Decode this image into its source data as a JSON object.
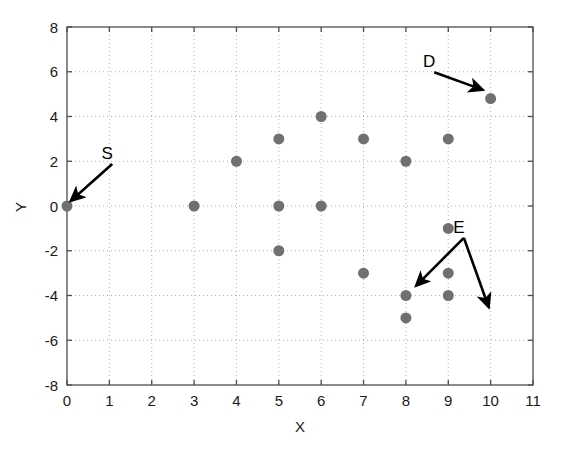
{
  "chart_data": {
    "type": "scatter",
    "title": "",
    "xlabel": "X",
    "ylabel": "Y",
    "xlim": [
      0,
      11
    ],
    "ylim": [
      -8,
      8
    ],
    "xticks": [
      0,
      1,
      2,
      3,
      4,
      5,
      6,
      7,
      8,
      9,
      10,
      11
    ],
    "xtick_labels": [
      "0",
      "1",
      "2",
      "3",
      "4",
      "5",
      "6",
      "7",
      "8",
      "9",
      "10",
      "11"
    ],
    "yticks": [
      -8,
      -6,
      -4,
      -2,
      0,
      2,
      4,
      6,
      8
    ],
    "ytick_labels": [
      "-8",
      "-6",
      "-4",
      "-2",
      "0",
      "2",
      "4",
      "6",
      "8"
    ],
    "grid": true,
    "grid_style": "dotted",
    "legend": null,
    "marker": {
      "shape": "circle",
      "color": "#707070",
      "size": 11
    },
    "points": [
      {
        "x": 0,
        "y": 0
      },
      {
        "x": 3,
        "y": 0
      },
      {
        "x": 4,
        "y": 2
      },
      {
        "x": 5,
        "y": 3
      },
      {
        "x": 5,
        "y": 0
      },
      {
        "x": 5,
        "y": -2
      },
      {
        "x": 6,
        "y": 4
      },
      {
        "x": 6,
        "y": 0
      },
      {
        "x": 7,
        "y": 3
      },
      {
        "x": 7,
        "y": -3
      },
      {
        "x": 8,
        "y": 2
      },
      {
        "x": 8,
        "y": -4
      },
      {
        "x": 8,
        "y": -5
      },
      {
        "x": 9,
        "y": 3
      },
      {
        "x": 9,
        "y": -1
      },
      {
        "x": 9,
        "y": -3
      },
      {
        "x": 9,
        "y": -4
      },
      {
        "x": 10,
        "y": 4.8
      }
    ],
    "annotations": [
      {
        "label": "S",
        "label_x": 0.95,
        "label_y": 2.1,
        "target_x": 0.1,
        "target_y": 0.25
      },
      {
        "label": "D",
        "label_x": 8.55,
        "label_y": 6.2,
        "target_x": 9.8,
        "target_y": 5.2
      },
      {
        "label": "E",
        "label_x": 9.25,
        "label_y": -1.2,
        "target_x": 8.25,
        "target_y": -3.55
      },
      {
        "label": "E",
        "label_x": 9.25,
        "label_y": -1.2,
        "target_x": 9.95,
        "target_y": -4.5
      }
    ]
  },
  "figure": {
    "background_color": "#ffffff",
    "axis_color": "#4d4d4d",
    "grid_color": "#b4b4b4",
    "annotation_color": "#000000"
  }
}
